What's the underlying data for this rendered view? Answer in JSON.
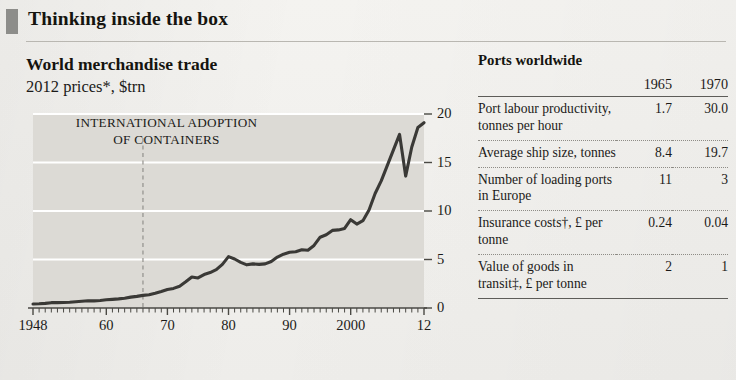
{
  "kicker": "Thinking inside the box",
  "chart": {
    "title": "World merchandise trade",
    "subtitle": "2012 prices*, $trn",
    "annotation_line1": "INTERNATIONAL ADOPTION",
    "annotation_line2": "OF CONTAINERS",
    "annotation_year": 1966,
    "colors": {
      "plot_background": "#dcdad5",
      "gridline": "#ffffff",
      "line": "#3a3936",
      "axis": "#4a4944",
      "marker_block": "#8d8d8a"
    }
  },
  "chart_data": {
    "type": "line",
    "title": "World merchandise trade",
    "subtitle": "2012 prices*, $trn",
    "xlabel": "",
    "ylabel": "$trn",
    "ylim": [
      0,
      20
    ],
    "yticks": [
      0,
      5,
      10,
      15,
      20
    ],
    "xlim": [
      1948,
      2012
    ],
    "xticks": [
      1948,
      1960,
      1970,
      1980,
      1990,
      2000,
      2012
    ],
    "xticklabels": [
      "1948",
      "60",
      "70",
      "80",
      "90",
      "2000",
      "12"
    ],
    "minor_xticks": "annual",
    "grid": "horizontal",
    "legend": "none",
    "annotations": [
      {
        "text": "INTERNATIONAL ADOPTION OF CONTAINERS",
        "x": 1966,
        "type": "vertical-dashed-line"
      }
    ],
    "series": [
      {
        "name": "World merchandise trade",
        "x": [
          1948,
          1949,
          1950,
          1951,
          1952,
          1953,
          1954,
          1955,
          1956,
          1957,
          1958,
          1959,
          1960,
          1961,
          1962,
          1963,
          1964,
          1965,
          1966,
          1967,
          1968,
          1969,
          1970,
          1971,
          1972,
          1973,
          1974,
          1975,
          1976,
          1977,
          1978,
          1979,
          1980,
          1981,
          1982,
          1983,
          1984,
          1985,
          1986,
          1987,
          1988,
          1989,
          1990,
          1991,
          1992,
          1993,
          1994,
          1995,
          1996,
          1997,
          1998,
          1999,
          2000,
          2001,
          2002,
          2003,
          2004,
          2005,
          2006,
          2007,
          2008,
          2009,
          2010,
          2011,
          2012
        ],
        "values": [
          0.42,
          0.44,
          0.48,
          0.55,
          0.55,
          0.57,
          0.6,
          0.65,
          0.7,
          0.74,
          0.73,
          0.78,
          0.85,
          0.89,
          0.94,
          1.01,
          1.12,
          1.2,
          1.3,
          1.36,
          1.52,
          1.7,
          1.9,
          2.02,
          2.25,
          2.7,
          3.2,
          3.1,
          3.45,
          3.65,
          3.95,
          4.5,
          5.3,
          5.05,
          4.7,
          4.45,
          4.55,
          4.5,
          4.55,
          4.8,
          5.25,
          5.55,
          5.75,
          5.8,
          6.0,
          5.95,
          6.45,
          7.3,
          7.55,
          8.0,
          8.05,
          8.2,
          9.1,
          8.65,
          9.0,
          10.1,
          11.8,
          13.1,
          14.7,
          16.3,
          17.9,
          13.6,
          16.6,
          18.6,
          19.1
        ]
      }
    ]
  },
  "yticklabels": [
    "0",
    "5",
    "10",
    "15",
    "20"
  ],
  "table": {
    "title": "Ports worldwide",
    "columns": [
      "",
      "1965",
      "1970"
    ],
    "rows": [
      {
        "label": "Port labour productivity, tonnes per hour",
        "y1965": "1.7",
        "y1970": "30.0"
      },
      {
        "label": "Average ship size, tonnes",
        "y1965": "8.4",
        "y1970": "19.7"
      },
      {
        "label": "Number of loading ports in Europe",
        "y1965": "11",
        "y1970": "3"
      },
      {
        "label": "Insurance costs†, £ per tonne",
        "y1965": "0.24",
        "y1970": "0.04"
      },
      {
        "label": "Value of goods in transit‡, £ per tonne",
        "y1965": "2",
        "y1970": "1"
      }
    ]
  }
}
